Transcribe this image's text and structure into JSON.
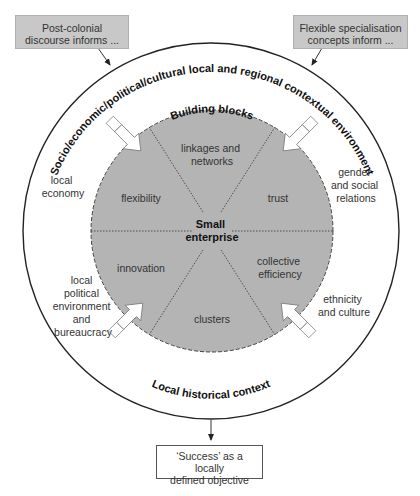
{
  "top_boxes": {
    "left": {
      "line1": "Post-colonial",
      "line2": "discourse informs ..."
    },
    "right": {
      "line1": "Flexible specialisation",
      "line2": "concepts inform ..."
    }
  },
  "outer_ring": {
    "top_arc_label": "Socio/economic/political/cultural local and regional contextual environment",
    "bottom_arc_label": "Local historical context"
  },
  "outer_factors": {
    "local_economy": [
      "local",
      "economy"
    ],
    "gender": [
      "gender",
      "and social",
      "relations"
    ],
    "political": [
      "local",
      "political",
      "environment",
      "and",
      "bureaucracy"
    ],
    "ethnicity": [
      "ethnicity",
      "and culture"
    ]
  },
  "inner_circle": {
    "arc_label": "Building blocks",
    "center": [
      "Small",
      "enterprise"
    ],
    "segments": {
      "top": [
        "linkages and",
        "networks"
      ],
      "upper_left": [
        "flexibility"
      ],
      "upper_right": [
        "trust"
      ],
      "lower_left": [
        "innovation"
      ],
      "lower_right": [
        "collective",
        "efficiency"
      ],
      "bottom": [
        "clusters"
      ]
    }
  },
  "bottom_box": {
    "line1": "‘Success’ as a locally",
    "line2": "defined objective"
  },
  "colors": {
    "inner_fill": "#b4b4b4",
    "box_fill": "#c8c8c8",
    "line": "#222222",
    "text": "#333333"
  }
}
